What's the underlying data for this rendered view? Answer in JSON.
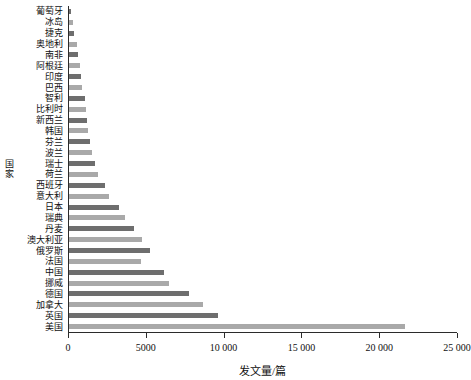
{
  "chart_data": {
    "type": "bar",
    "orientation": "horizontal",
    "title": "",
    "xlabel": "发文量/篇",
    "ylabel": "国家",
    "xlim": [
      0,
      25000
    ],
    "grid": false,
    "legend": false,
    "xticks": [
      0,
      5000,
      10000,
      15000,
      20000,
      25000
    ],
    "xtick_labels": [
      "0",
      "5000",
      "10 000",
      "15 000",
      "20 000",
      "25 000"
    ],
    "bar_colors": [
      "#6e6e6e",
      "#a9a9a9"
    ],
    "categories": [
      "葡萄牙",
      "冰岛",
      "捷克",
      "奥地利",
      "南非",
      "阿根廷",
      "印度",
      "巴西",
      "智利",
      "比利时",
      "新西兰",
      "韩国",
      "芬兰",
      "波兰",
      "瑞士",
      "荷兰",
      "西班牙",
      "意大利",
      "日本",
      "瑞典",
      "丹麦",
      "澳大利亚",
      "俄罗斯",
      "法国",
      "中国",
      "挪威",
      "德国",
      "加拿大",
      "英国",
      "美国"
    ],
    "values": [
      150,
      270,
      330,
      500,
      580,
      700,
      780,
      840,
      1000,
      1080,
      1150,
      1230,
      1350,
      1500,
      1700,
      1850,
      2300,
      2600,
      3200,
      3600,
      4200,
      4700,
      5200,
      4600,
      6100,
      6400,
      7700,
      8600,
      9600,
      21600
    ]
  }
}
